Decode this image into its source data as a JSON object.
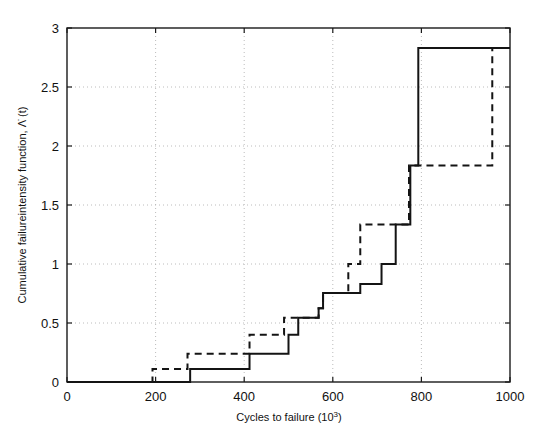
{
  "chart_data": {
    "type": "line",
    "subtype": "step",
    "title": "",
    "xlabel": "Cycles to failure (10",
    "xlabel_sup": "3",
    "xlabel_tail": ")",
    "ylabel": "Cumulative failureintensity function,  Λ̇ (t)",
    "xlim": [
      0,
      1000
    ],
    "ylim": [
      0,
      3
    ],
    "xticks": [
      0,
      200,
      400,
      600,
      800,
      1000
    ],
    "xtick_labels": [
      "0",
      "200",
      "400",
      "600",
      "800",
      "1000"
    ],
    "yticks": [
      0,
      0.5,
      1,
      1.5,
      2,
      2.5,
      3
    ],
    "ytick_labels": [
      "0",
      "0.5",
      "1",
      "1.5",
      "2",
      "2.5",
      "3"
    ],
    "grid": true,
    "grid_style": "dotted",
    "grid_color": "#b4b4b4",
    "axes_color": "#1a1a1a",
    "background": "#ffffff",
    "legend": null,
    "legend_position": "none",
    "series": [
      {
        "name": "solid-step",
        "style": "solid",
        "color": "#141414",
        "width": 2.0,
        "x": [
          0,
          278,
          278,
          412,
          412,
          500,
          500,
          522,
          522,
          568,
          568,
          578,
          578,
          662,
          662,
          710,
          710,
          742,
          742,
          775,
          775,
          793,
          793,
          1000
        ],
        "y": [
          0,
          0,
          0.11,
          0.11,
          0.24,
          0.24,
          0.4,
          0.4,
          0.545,
          0.545,
          0.625,
          0.625,
          0.755,
          0.755,
          0.83,
          0.83,
          1.0,
          1.0,
          1.335,
          1.335,
          1.835,
          1.835,
          2.83,
          2.83
        ]
      },
      {
        "name": "dashed-step",
        "style": "dashed",
        "color": "#141414",
        "width": 2.0,
        "x": [
          0,
          193,
          193,
          272,
          272,
          412,
          412,
          490,
          490,
          568,
          568,
          578,
          578,
          635,
          635,
          662,
          662,
          772,
          772,
          960,
          960,
          1000
        ],
        "y": [
          0,
          0,
          0.11,
          0.11,
          0.24,
          0.24,
          0.4,
          0.4,
          0.545,
          0.545,
          0.625,
          0.625,
          0.755,
          0.755,
          1.0,
          1.0,
          1.335,
          1.335,
          1.835,
          1.835,
          2.83,
          2.83
        ]
      }
    ],
    "annotations": []
  },
  "plot_geometry": {
    "left": 67,
    "right": 510,
    "top": 28,
    "bottom": 382
  }
}
